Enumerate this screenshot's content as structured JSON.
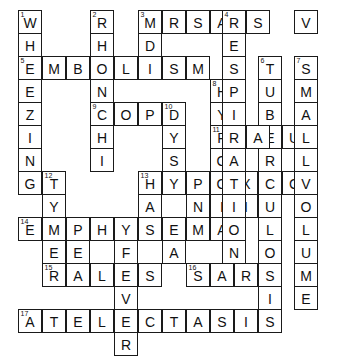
{
  "puzzle": {
    "title": "Respiratory Terms Crossword",
    "grid": {
      "cols": 14,
      "rows": 14,
      "cell_px": 24,
      "origin_x": 18,
      "origin_y": 10,
      "cell_bg": "#ffffff",
      "cell_border": "#1a1a1a",
      "letter_color": "#111111",
      "number_color": "#111111",
      "page_bg": "#ffffff"
    },
    "cells": [
      {
        "n": "1",
        "l": "W",
        "c": 0,
        "r": 0
      },
      {
        "n": "",
        "l": "H",
        "c": 0,
        "r": 1
      },
      {
        "n": "5",
        "l": "E",
        "c": 0,
        "r": 2
      },
      {
        "n": "",
        "l": "E",
        "c": 0,
        "r": 3
      },
      {
        "n": "",
        "l": "Z",
        "c": 0,
        "r": 4
      },
      {
        "n": "",
        "l": "I",
        "c": 0,
        "r": 5
      },
      {
        "n": "",
        "l": "N",
        "c": 0,
        "r": 6
      },
      {
        "n": "",
        "l": "G",
        "c": 0,
        "r": 7
      },
      {
        "n": "",
        "l": "M",
        "c": 1,
        "r": 2
      },
      {
        "n": "",
        "l": "B",
        "c": 2,
        "r": 2
      },
      {
        "n": "2",
        "l": "R",
        "c": 3,
        "r": 0
      },
      {
        "n": "",
        "l": "H",
        "c": 3,
        "r": 1
      },
      {
        "n": "",
        "l": "O",
        "c": 3,
        "r": 2
      },
      {
        "n": "",
        "l": "N",
        "c": 3,
        "r": 3
      },
      {
        "n": "9",
        "l": "C",
        "c": 3,
        "r": 4
      },
      {
        "n": "",
        "l": "H",
        "c": 3,
        "r": 5
      },
      {
        "n": "",
        "l": "I",
        "c": 3,
        "r": 6
      },
      {
        "n": "",
        "l": "L",
        "c": 4,
        "r": 2
      },
      {
        "n": "",
        "l": "O",
        "c": 4,
        "r": 4
      },
      {
        "n": "12",
        "l": "T",
        "c": 1,
        "r": 7
      },
      {
        "n": "",
        "l": "Y",
        "c": 1,
        "r": 8
      },
      {
        "n": "",
        "l": "P",
        "c": 1,
        "r": 9
      },
      {
        "n": "",
        "l": "E",
        "c": 1,
        "r": 10
      },
      {
        "n": "3",
        "l": "M",
        "c": 5,
        "r": 0
      },
      {
        "n": "",
        "l": "R",
        "c": 6,
        "r": 0
      },
      {
        "n": "",
        "l": "S",
        "c": 7,
        "r": 0
      },
      {
        "n": "",
        "l": "A",
        "c": 8,
        "r": 0
      },
      {
        "n": "",
        "l": "D",
        "c": 5,
        "r": 1
      },
      {
        "n": "",
        "l": "I",
        "c": 5,
        "r": 2
      },
      {
        "n": "",
        "l": "S",
        "c": 6,
        "r": 2
      },
      {
        "n": "",
        "l": "M",
        "c": 7,
        "r": 2
      },
      {
        "n": "",
        "l": "P",
        "c": 5,
        "r": 4
      },
      {
        "n": "10",
        "l": "D",
        "c": 6,
        "r": 4
      },
      {
        "n": "",
        "l": "Y",
        "c": 6,
        "r": 5
      },
      {
        "n": "",
        "l": "S",
        "c": 6,
        "r": 6
      },
      {
        "n": "8",
        "l": "H",
        "c": 8,
        "r": 3
      },
      {
        "n": "",
        "l": "Y",
        "c": 8,
        "r": 4
      },
      {
        "n": "11",
        "l": "P",
        "c": 8,
        "r": 5
      },
      {
        "n": "",
        "l": "O",
        "c": 8,
        "r": 6
      },
      {
        "n": "",
        "l": "X",
        "c": 8,
        "r": 7
      },
      {
        "n": "",
        "l": "I",
        "c": 8,
        "r": 8
      },
      {
        "n": "",
        "l": "A",
        "c": 8,
        "r": 9
      },
      {
        "n": "13",
        "l": "H",
        "c": 5,
        "r": 7
      },
      {
        "n": "",
        "l": "Y",
        "c": 6,
        "r": 7
      },
      {
        "n": "",
        "l": "P",
        "c": 7,
        "r": 7
      },
      {
        "n": "",
        "l": "O",
        "c": 8,
        "r": 7
      },
      {
        "n": "",
        "l": "X",
        "c": 9,
        "r": 7
      },
      {
        "n": "",
        "l": "I",
        "c": 10,
        "r": 7
      },
      {
        "n": "",
        "l": "C",
        "c": 11,
        "r": 7
      },
      {
        "n": "",
        "l": "A",
        "c": 5,
        "r": 8
      },
      {
        "n": "",
        "l": "N",
        "c": 7,
        "r": 8
      },
      {
        "n": "",
        "l": "I",
        "c": 9,
        "r": 8
      },
      {
        "n": "14",
        "l": "E",
        "c": 0,
        "r": 9
      },
      {
        "n": "",
        "l": "M",
        "c": 1,
        "r": 9
      },
      {
        "n": "",
        "l": "P",
        "c": 2,
        "r": 9
      },
      {
        "n": "",
        "l": "H",
        "c": 3,
        "r": 9
      },
      {
        "n": "",
        "l": "Y",
        "c": 4,
        "r": 9
      },
      {
        "n": "",
        "l": "S",
        "c": 5,
        "r": 9
      },
      {
        "n": "",
        "l": "E",
        "c": 6,
        "r": 9
      },
      {
        "n": "",
        "l": "M",
        "c": 7,
        "r": 9
      },
      {
        "n": "",
        "l": "A",
        "c": 8,
        "r": 9
      },
      {
        "n": "",
        "l": "E",
        "c": 2,
        "r": 10
      },
      {
        "n": "",
        "l": "F",
        "c": 4,
        "r": 10
      },
      {
        "n": "",
        "l": "A",
        "c": 6,
        "r": 10
      },
      {
        "n": "15",
        "l": "R",
        "c": 1,
        "r": 11
      },
      {
        "n": "",
        "l": "A",
        "c": 2,
        "r": 11
      },
      {
        "n": "",
        "l": "L",
        "c": 3,
        "r": 11
      },
      {
        "n": "",
        "l": "E",
        "c": 4,
        "r": 11
      },
      {
        "n": "",
        "l": "S",
        "c": 5,
        "r": 11
      },
      {
        "n": "16",
        "l": "S",
        "c": 7,
        "r": 11
      },
      {
        "n": "",
        "l": "A",
        "c": 8,
        "r": 11
      },
      {
        "n": "",
        "l": "R",
        "c": 9,
        "r": 11
      },
      {
        "n": "",
        "l": "S",
        "c": 10,
        "r": 11
      },
      {
        "n": "",
        "l": "V",
        "c": 4,
        "r": 12
      },
      {
        "n": "",
        "l": "I",
        "c": 10,
        "r": 12
      },
      {
        "n": "17",
        "l": "A",
        "c": 0,
        "r": 13
      },
      {
        "n": "",
        "l": "T",
        "c": 1,
        "r": 13
      },
      {
        "n": "",
        "l": "E",
        "c": 2,
        "r": 13
      },
      {
        "n": "",
        "l": "L",
        "c": 3,
        "r": 13
      },
      {
        "n": "",
        "l": "E",
        "c": 4,
        "r": 13
      },
      {
        "n": "",
        "l": "C",
        "c": 5,
        "r": 13
      },
      {
        "n": "",
        "l": "T",
        "c": 6,
        "r": 13
      },
      {
        "n": "",
        "l": "A",
        "c": 7,
        "r": 13
      },
      {
        "n": "",
        "l": "S",
        "c": 8,
        "r": 13
      },
      {
        "n": "",
        "l": "I",
        "c": 9,
        "r": 13
      },
      {
        "n": "",
        "l": "S",
        "c": 10,
        "r": 13
      },
      {
        "n": "",
        "l": "R",
        "c": 4,
        "r": 14
      },
      {
        "n": "6",
        "l": "T",
        "c": 10,
        "r": 2
      },
      {
        "n": "",
        "l": "U",
        "c": 10,
        "r": 3
      },
      {
        "n": "",
        "l": "B",
        "c": 10,
        "r": 4
      },
      {
        "n": "",
        "l": "E",
        "c": 10,
        "r": 5
      },
      {
        "n": "",
        "l": "R",
        "c": 10,
        "r": 6
      },
      {
        "n": "",
        "l": "C",
        "c": 10,
        "r": 7
      },
      {
        "n": "",
        "l": "U",
        "c": 10,
        "r": 8
      },
      {
        "n": "",
        "l": "L",
        "c": 10,
        "r": 9
      },
      {
        "n": "",
        "l": "O",
        "c": 10,
        "r": 10
      },
      {
        "n": "",
        "l": "S",
        "c": 10,
        "r": 11
      },
      {
        "n": "",
        "l": "I",
        "c": 10,
        "r": 12
      },
      {
        "n": "",
        "l": "S",
        "c": 10,
        "r": 13
      },
      {
        "n": "",
        "l": "L",
        "c": 9,
        "r": 5
      },
      {
        "n": "",
        "l": "E",
        "c": 10,
        "r": 5
      },
      {
        "n": "",
        "l": "U",
        "c": 11,
        "r": 5
      },
      {
        "n": "",
        "l": "R",
        "c": 12,
        "r": 5
      },
      {
        "n": "",
        "l": "A",
        "c": 13,
        "r": 5
      },
      {
        "n": "",
        "l": "L",
        "c": 14,
        "r": 5
      },
      {
        "n": "4",
        "l": "R",
        "c": 12,
        "r": 0
      },
      {
        "n": "",
        "l": "S",
        "c": 13,
        "r": 0
      },
      {
        "n": "",
        "l": "V",
        "c": 14,
        "r": 0
      },
      {
        "n": "",
        "l": "E",
        "c": 12,
        "r": 1
      },
      {
        "n": "",
        "l": "S",
        "c": 12,
        "r": 2
      },
      {
        "n": "",
        "l": "P",
        "c": 12,
        "r": 3
      },
      {
        "n": "",
        "l": "I",
        "c": 12,
        "r": 4
      },
      {
        "n": "",
        "l": "A",
        "c": 12,
        "r": 6
      },
      {
        "n": "",
        "l": "T",
        "c": 12,
        "r": 7
      },
      {
        "n": "",
        "l": "I",
        "c": 12,
        "r": 8
      },
      {
        "n": "",
        "l": "O",
        "c": 12,
        "r": 9
      },
      {
        "n": "",
        "l": "N",
        "c": 12,
        "r": 10
      },
      {
        "n": "7",
        "l": "S",
        "c": 14,
        "r": 2
      },
      {
        "n": "",
        "l": "M",
        "c": 14,
        "r": 3
      },
      {
        "n": "",
        "l": "A",
        "c": 14,
        "r": 4
      },
      {
        "n": "",
        "l": "L",
        "c": 14,
        "r": 6
      },
      {
        "n": "",
        "l": "V",
        "c": 14,
        "r": 7
      },
      {
        "n": "",
        "l": "O",
        "c": 14,
        "r": 8
      },
      {
        "n": "",
        "l": "L",
        "c": 14,
        "r": 9
      },
      {
        "n": "",
        "l": "U",
        "c": 14,
        "r": 10
      },
      {
        "n": "",
        "l": "M",
        "c": 14,
        "r": 11
      },
      {
        "n": "",
        "l": "E",
        "c": 14,
        "r": 12
      }
    ],
    "answers": {
      "across": [
        {
          "number": "3",
          "answer": "MRSA"
        },
        {
          "number": "4",
          "answer": "RSV"
        },
        {
          "number": "5",
          "answer": "EMBOLISM"
        },
        {
          "number": "9",
          "answer": "COPD"
        },
        {
          "number": "11",
          "answer": "PLEURAL"
        },
        {
          "number": "13",
          "answer": "HYPOXIC"
        },
        {
          "number": "14",
          "answer": "EMPHYSEMA"
        },
        {
          "number": "15",
          "answer": "RALES"
        },
        {
          "number": "16",
          "answer": "SARS"
        },
        {
          "number": "17",
          "answer": "ATELECTASIS"
        }
      ],
      "down": [
        {
          "number": "1",
          "answer": "WHEEZING"
        },
        {
          "number": "2",
          "answer": "RHONCHI"
        },
        {
          "number": "3",
          "answer": "MDI"
        },
        {
          "number": "4",
          "answer": "RESPIRATION"
        },
        {
          "number": "6",
          "answer": "TUBERCULOSIS"
        },
        {
          "number": "7",
          "answer": "SMALLVOLUME"
        },
        {
          "number": "8",
          "answer": "HYPOXIA"
        },
        {
          "number": "10",
          "answer": "DYSPNEA"
        },
        {
          "number": "12",
          "answer": "TYPE"
        },
        {
          "number": "13",
          "answer": "HYDRA"
        },
        {
          "number": "16",
          "answer": "SARS"
        }
      ]
    }
  }
}
